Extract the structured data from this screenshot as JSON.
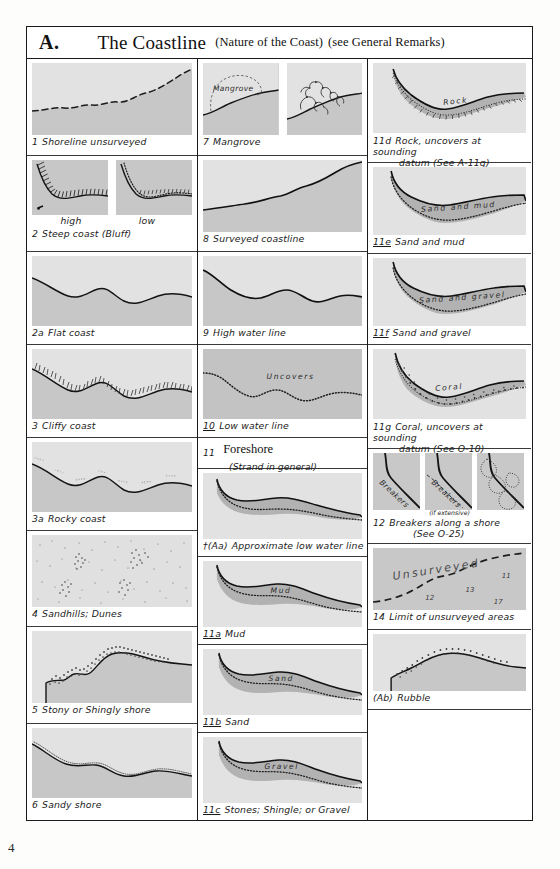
{
  "header": {
    "letter": "A.",
    "title": "The Coastline",
    "subtitle": "(Nature of the Coast)",
    "subtitle2": "(see General Remarks)"
  },
  "page_number": "4",
  "colors": {
    "land": "#c7c7c7",
    "water": "#e2e2e2",
    "foreshore": "#b4b4b4",
    "ink": "#1a1a1a",
    "paper": "#ffffff"
  },
  "column1": [
    {
      "num": "1",
      "label": "Shoreline unsurveyed",
      "underline": false
    },
    {
      "num": "2",
      "label": "Steep coast (Bluff)",
      "underline": false,
      "sublabels": [
        "high",
        "low"
      ]
    },
    {
      "num": "2a",
      "label": "Flat coast",
      "underline": false
    },
    {
      "num": "3",
      "label": "Cliffy coast",
      "underline": false
    },
    {
      "num": "3a",
      "label": "Rocky coast",
      "underline": false
    },
    {
      "num": "4",
      "label": "Sandhills; Dunes",
      "underline": false
    },
    {
      "num": "5",
      "label": "Stony or Shingly shore",
      "underline": false
    },
    {
      "num": "6",
      "label": "Sandy shore",
      "underline": false
    }
  ],
  "column2": [
    {
      "num": "7",
      "label": "Mangrove",
      "underline": false,
      "figure_label": "Mangrove"
    },
    {
      "num": "8",
      "label": "Surveyed coastline",
      "underline": false
    },
    {
      "num": "9",
      "label": "High water line",
      "underline": false
    },
    {
      "num": "10",
      "label": "Low water line",
      "underline": true,
      "figure_label": "Uncovers"
    },
    {
      "num": "11",
      "label": "Foreshore",
      "label2": "(Strand in general)",
      "heading": true
    },
    {
      "num": "†(Aa)",
      "label": "Approximate low water line",
      "underline": false
    },
    {
      "num": "11a",
      "label": "Mud",
      "underline": true,
      "figure_label": "Mud"
    },
    {
      "num": "11b",
      "label": "Sand",
      "underline": true,
      "figure_label": "Sand"
    },
    {
      "num": "11c",
      "label": "Stones; Shingle; or Gravel",
      "underline": true,
      "figure_label": "Gravel"
    }
  ],
  "column3": [
    {
      "num": "11d",
      "label": "Rock, uncovers at sounding",
      "label2": "datum (See A-11g)",
      "figure_label": "Rock"
    },
    {
      "num": "11e",
      "label": "Sand and mud",
      "underline": true,
      "figure_label": "Sand and mud"
    },
    {
      "num": "11f",
      "label": "Sand and gravel",
      "underline": true,
      "figure_label": "Sand and gravel"
    },
    {
      "num": "11g",
      "label": "Coral, uncovers at sounding",
      "label2": "datum (See O-10)",
      "figure_label": "Coral"
    },
    {
      "num": "12",
      "label": "Breakers along a shore",
      "label2": "(See O-25)",
      "figure_label": "Breakers",
      "note": "(if extensive)"
    },
    {
      "num": "14",
      "label": "Limit of unsurveyed areas",
      "figure_label": "Unsurveyed",
      "soundings": [
        "12",
        "13",
        "11",
        "17"
      ]
    },
    {
      "num": "(Ab)",
      "label": "Rubble",
      "underline": false
    }
  ]
}
